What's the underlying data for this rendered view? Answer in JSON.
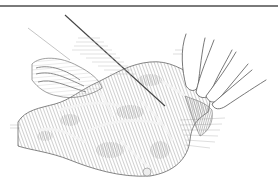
{
  "illustration": {
    "subject": "hand slicing a steak with a knife",
    "style": "pen-and-ink crosshatch engraving",
    "colors": {
      "background": "#ffffff",
      "rule": "#7a7a7a",
      "ink": "#555555",
      "meat_dark": "#9a9a9a",
      "meat_mid": "#c4c4c4",
      "fat": "#f2f2f2"
    }
  }
}
